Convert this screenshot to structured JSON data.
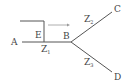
{
  "diagram": {
    "nodes": {
      "A": "A",
      "B": "B",
      "C": "C",
      "D": "D",
      "E": "E"
    },
    "segments": {
      "z1": {
        "base": "Z",
        "sub": "1"
      },
      "z2": {
        "base": "Z",
        "sub": "2"
      },
      "z3": {
        "base": "Z",
        "sub": "3"
      }
    },
    "colors": {
      "line": "#555555",
      "arrow": "#999999",
      "text": "#444444"
    }
  }
}
